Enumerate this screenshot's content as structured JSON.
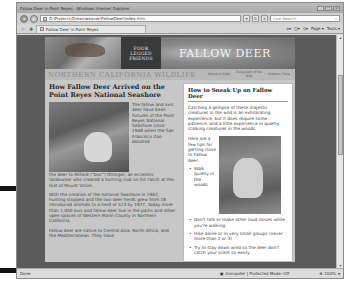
{
  "browser": {
    "window_title": "Fallow Deer in Point Reyes - Windows Internet Explorer",
    "address": "D:\\Projects\\Dreamweaver\\FallowDeer\\index.htm",
    "search_placeholder": "Live Search",
    "tab_label": "Fallow Deer in Point Reyes",
    "toolbar": {
      "home_icon": "home-icon",
      "feeds_icon": "feeds-icon",
      "print_icon": "print-icon",
      "page_label": "Page ▾",
      "tools_label": "Tools ▾"
    },
    "status": {
      "left": "Done",
      "zone": "Computer | Protected Mode: Off",
      "zoom": "100%"
    }
  },
  "site": {
    "logo_lines": [
      "FOUR",
      "LEGGED",
      "FRIENDS"
    ],
    "hero_title": "FALLOW DEER",
    "site_name": "NORTHERN CALIFORNIA WILDLIFE",
    "nav": [
      {
        "label": "Where to Sight"
      },
      {
        "label": "Ecosystem of the Wild"
      },
      {
        "label": "Endemic Flora"
      }
    ]
  },
  "main": {
    "heading": "How Fallow Deer Arrived on the Point Reyes National Seashore",
    "figure_caption_text": "The fallow and axis deer have been fixtures of the Point Reyes National Seashore since 1948 when the San Francisco Zoo donated",
    "paragraphs": [
      "the deer to Millard (\"Doc\") Ottinger, an eccentric landowner who created a hunting club on his ranch at the foot of Mount Vision.",
      "With the creation of the national Seashore in 1962, hunting stopped and the two deer herds grew from 28 introduced animals to a herd of 523 by 1977. Today more than 1,000 axis and fallow deer live in the parks and other open spaces of Western Marin County in Northern California.",
      "Fallow deer are native to Central Asia, North Africa, and the Mediterranean. They have"
    ]
  },
  "sidebar": {
    "heading": "How to Sneak Up on Fallow Deer",
    "intro": "Catching a glimpse of these majestic creatures in the wild is an exhilarating experience, but it does require some patience, and a little experience in quietly stalking creatures in the woods.",
    "tips_intro": "Here are a few tips for getting close to Fallow deer:",
    "tips": [
      "Walk quietly in the woods",
      "Don't talk or make other loud noises while you're walking",
      "Hike alone or in very small groups (never more than 2 or 3)",
      "Try to stay down wind so the deer don't catch your scent so easily"
    ]
  }
}
